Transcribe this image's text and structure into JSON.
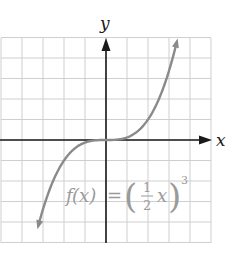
{
  "chart_data": {
    "type": "line",
    "title": "",
    "xlabel": "x",
    "ylabel": "y",
    "xlim": [
      -5,
      5
    ],
    "ylim": [
      -5,
      5
    ],
    "grid": true,
    "grid_step": 1,
    "tick_labels": false,
    "series": [
      {
        "name": "f(x) = (1/2 x)^3",
        "function": "(x/2)^3",
        "x": [
          -3.2,
          -3,
          -2.5,
          -2,
          -1.5,
          -1,
          -0.5,
          0,
          0.5,
          1,
          1.5,
          2,
          2.5,
          3,
          3.35
        ],
        "y": [
          -4.1,
          -3.375,
          -1.953,
          -1,
          -0.422,
          -0.125,
          -0.016,
          0,
          0.016,
          0.125,
          0.422,
          1,
          1.953,
          3.375,
          4.7
        ],
        "color": "#8a8a8a",
        "arrows_at_ends": true
      }
    ],
    "annotations": [
      {
        "text": "f(x) = (1/2 x)^3",
        "position": "lower-center"
      }
    ]
  },
  "labels": {
    "x_axis": "x",
    "y_axis": "y",
    "eq_f": "f",
    "eq_paren_x": "(x)",
    "eq_equals": "=",
    "eq_num": "1",
    "eq_den": "2",
    "eq_var": "x",
    "eq_exp": "3"
  },
  "colors": {
    "grid": "#cfcfcf",
    "axis": "#1a1a1a",
    "curve": "#8a8a8a",
    "equation": "#9a9a9a"
  }
}
